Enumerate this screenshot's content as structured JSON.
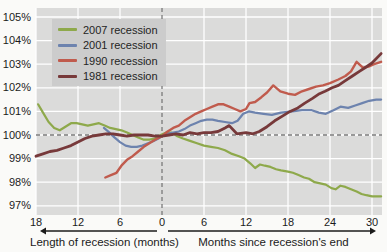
{
  "chart_data": {
    "type": "line",
    "title": "",
    "y_axis": {
      "unit": "%",
      "range": [
        97,
        105
      ],
      "ticks": [
        {
          "value": 105,
          "label": "105%"
        },
        {
          "value": 104,
          "label": "104%"
        },
        {
          "value": 103,
          "label": "103%"
        },
        {
          "value": 102,
          "label": "102%"
        },
        {
          "value": 101,
          "label": "101%"
        },
        {
          "value": 100,
          "label": "100%"
        },
        {
          "value": 99,
          "label": "99%"
        },
        {
          "value": 98,
          "label": "98%"
        },
        {
          "value": 97,
          "label": "97%"
        }
      ]
    },
    "x_axis": {
      "range_months": [
        -18,
        31
      ],
      "left_caption": "Length of recession (months)",
      "right_caption": "Months since recession's end",
      "ticks": [
        {
          "month": -18,
          "label": "18"
        },
        {
          "month": -12,
          "label": "12"
        },
        {
          "month": -6,
          "label": "6"
        },
        {
          "month": 0,
          "label": "0"
        },
        {
          "month": 6,
          "label": "6"
        },
        {
          "month": 12,
          "label": "12"
        },
        {
          "month": 18,
          "label": "18"
        },
        {
          "month": 24,
          "label": "24"
        },
        {
          "month": 30,
          "label": "30"
        }
      ],
      "gridline_months": [
        -18,
        -12,
        -6,
        6,
        12,
        18,
        24,
        30
      ]
    },
    "reference_lines": {
      "vertical_month": 0,
      "horizontal_value": 100,
      "style": "dashed",
      "color": "#7a7a7a"
    },
    "legend_position": "top-left",
    "grid": true,
    "colors": {
      "plot_background": "#dbdbda",
      "legend_background": "#cccccc",
      "gridline": "#ffffff",
      "text": "#1b1b1b"
    },
    "series": [
      {
        "name": "2007 recession",
        "color": "#8ea94b",
        "width": 2.2,
        "points": [
          [
            -17.7,
            101.3
          ],
          [
            -17,
            100.95
          ],
          [
            -16.2,
            100.55
          ],
          [
            -15.4,
            100.3
          ],
          [
            -14.6,
            100.2
          ],
          [
            -13.8,
            100.35
          ],
          [
            -13,
            100.5
          ],
          [
            -12.2,
            100.5
          ],
          [
            -11.4,
            100.45
          ],
          [
            -10.6,
            100.4
          ],
          [
            -9.8,
            100.45
          ],
          [
            -9,
            100.5
          ],
          [
            -8.2,
            100.4
          ],
          [
            -7.4,
            100.3
          ],
          [
            -6.6,
            100.25
          ],
          [
            -5.8,
            100.2
          ],
          [
            -5,
            100.1
          ],
          [
            -4.2,
            100.0
          ],
          [
            -3.4,
            99.9
          ],
          [
            -2.6,
            99.8
          ],
          [
            -1.8,
            99.8
          ],
          [
            -1,
            99.85
          ],
          [
            -0.2,
            100.0
          ],
          [
            0.6,
            100.1
          ],
          [
            1.4,
            100.1
          ],
          [
            2.2,
            99.95
          ],
          [
            3,
            99.85
          ],
          [
            4,
            99.75
          ],
          [
            5,
            99.65
          ],
          [
            6,
            99.55
          ],
          [
            7,
            99.5
          ],
          [
            8,
            99.45
          ],
          [
            9,
            99.35
          ],
          [
            10,
            99.2
          ],
          [
            11,
            99.1
          ],
          [
            11.8,
            99.0
          ],
          [
            12.6,
            98.8
          ],
          [
            13.3,
            98.6
          ],
          [
            14,
            98.75
          ],
          [
            14.7,
            98.7
          ],
          [
            15.5,
            98.65
          ],
          [
            16.3,
            98.55
          ],
          [
            17,
            98.5
          ],
          [
            18,
            98.45
          ],
          [
            18.7,
            98.4
          ],
          [
            19.5,
            98.3
          ],
          [
            20.3,
            98.2
          ],
          [
            21,
            98.15
          ],
          [
            21.8,
            98.0
          ],
          [
            22.6,
            97.95
          ],
          [
            23.4,
            97.9
          ],
          [
            24.2,
            97.75
          ],
          [
            24.8,
            97.7
          ],
          [
            25.5,
            97.85
          ],
          [
            26.2,
            97.8
          ],
          [
            27,
            97.7
          ],
          [
            27.8,
            97.6
          ],
          [
            28.5,
            97.5
          ],
          [
            29.2,
            97.45
          ],
          [
            30,
            97.4
          ],
          [
            31.3,
            97.4
          ]
        ]
      },
      {
        "name": "2001 recession",
        "color": "#6d83ae",
        "width": 2.2,
        "points": [
          [
            -8.3,
            100.3
          ],
          [
            -7.5,
            100.1
          ],
          [
            -6.8,
            99.9
          ],
          [
            -6,
            99.7
          ],
          [
            -5.2,
            99.55
          ],
          [
            -4.4,
            99.5
          ],
          [
            -3.6,
            99.5
          ],
          [
            -2.8,
            99.55
          ],
          [
            -2,
            99.65
          ],
          [
            -1.2,
            99.75
          ],
          [
            -0.5,
            99.85
          ],
          [
            0,
            99.95
          ],
          [
            0.8,
            100.05
          ],
          [
            1.6,
            100.1
          ],
          [
            2.4,
            100.15
          ],
          [
            3.2,
            100.25
          ],
          [
            4,
            100.4
          ],
          [
            4.8,
            100.5
          ],
          [
            5.6,
            100.6
          ],
          [
            6.4,
            100.65
          ],
          [
            7.2,
            100.65
          ],
          [
            8,
            100.6
          ],
          [
            9,
            100.55
          ],
          [
            10,
            100.5
          ],
          [
            10.8,
            100.6
          ],
          [
            11.6,
            100.9
          ],
          [
            12.4,
            101.0
          ],
          [
            13.3,
            100.95
          ],
          [
            14.5,
            100.9
          ],
          [
            15.7,
            100.85
          ],
          [
            17,
            100.95
          ],
          [
            18.6,
            101.0
          ],
          [
            20,
            101.05
          ],
          [
            21.4,
            101.05
          ],
          [
            22.4,
            100.95
          ],
          [
            23.4,
            100.9
          ],
          [
            24.5,
            101.05
          ],
          [
            25.5,
            101.2
          ],
          [
            26.6,
            101.15
          ],
          [
            27.6,
            101.25
          ],
          [
            28.6,
            101.35
          ],
          [
            29.6,
            101.45
          ],
          [
            30.6,
            101.5
          ],
          [
            31.3,
            101.5
          ]
        ]
      },
      {
        "name": "1990 recession",
        "color": "#c05b4d",
        "width": 2.4,
        "points": [
          [
            -8.1,
            98.2
          ],
          [
            -7.3,
            98.3
          ],
          [
            -6.5,
            98.4
          ],
          [
            -5.8,
            98.7
          ],
          [
            -5,
            98.95
          ],
          [
            -4.2,
            99.1
          ],
          [
            -3.4,
            99.3
          ],
          [
            -2.6,
            99.5
          ],
          [
            -1.8,
            99.65
          ],
          [
            -1,
            99.8
          ],
          [
            0,
            99.95
          ],
          [
            0.8,
            100.15
          ],
          [
            1.6,
            100.3
          ],
          [
            2.4,
            100.4
          ],
          [
            3.2,
            100.6
          ],
          [
            4,
            100.75
          ],
          [
            4.8,
            100.9
          ],
          [
            5.6,
            101.0
          ],
          [
            6.4,
            101.1
          ],
          [
            7.2,
            101.2
          ],
          [
            8,
            101.3
          ],
          [
            8.8,
            101.3
          ],
          [
            9.6,
            101.2
          ],
          [
            10.4,
            101.1
          ],
          [
            11.2,
            101.0
          ],
          [
            12,
            101.1
          ],
          [
            12.5,
            101.35
          ],
          [
            13.3,
            101.4
          ],
          [
            14.2,
            101.6
          ],
          [
            15,
            101.8
          ],
          [
            15.9,
            102.1
          ],
          [
            16.9,
            101.85
          ],
          [
            18,
            101.75
          ],
          [
            19,
            101.7
          ],
          [
            20,
            101.85
          ],
          [
            21,
            101.95
          ],
          [
            22,
            102.05
          ],
          [
            23,
            102.1
          ],
          [
            24,
            102.2
          ],
          [
            25.2,
            102.35
          ],
          [
            26.2,
            102.5
          ],
          [
            27,
            102.7
          ],
          [
            27.8,
            103.1
          ],
          [
            28.7,
            102.85
          ],
          [
            29.5,
            102.9
          ],
          [
            30.3,
            103.0
          ],
          [
            31.3,
            103.1
          ]
        ]
      },
      {
        "name": "1981 recession",
        "color": "#77393a",
        "width": 2.8,
        "points": [
          [
            -18,
            99.1
          ],
          [
            -17,
            99.2
          ],
          [
            -16,
            99.3
          ],
          [
            -15,
            99.35
          ],
          [
            -14,
            99.45
          ],
          [
            -13,
            99.55
          ],
          [
            -12,
            99.7
          ],
          [
            -11,
            99.85
          ],
          [
            -10,
            99.95
          ],
          [
            -9,
            100.0
          ],
          [
            -8,
            100.05
          ],
          [
            -7,
            100.05
          ],
          [
            -6,
            100.0
          ],
          [
            -5,
            99.95
          ],
          [
            -4,
            100.0
          ],
          [
            -3,
            100.0
          ],
          [
            -2,
            100.0
          ],
          [
            -1,
            99.95
          ],
          [
            0,
            99.95
          ],
          [
            1,
            100.0
          ],
          [
            2,
            100.05
          ],
          [
            3,
            100.0
          ],
          [
            4,
            100.1
          ],
          [
            5,
            100.05
          ],
          [
            6,
            100.1
          ],
          [
            7,
            100.1
          ],
          [
            8,
            100.15
          ],
          [
            9,
            100.3
          ],
          [
            9.6,
            100.4
          ],
          [
            10.7,
            100.05
          ],
          [
            12,
            100.1
          ],
          [
            13,
            100.05
          ],
          [
            13.9,
            100.15
          ],
          [
            15,
            100.35
          ],
          [
            16.1,
            100.6
          ],
          [
            17.2,
            100.8
          ],
          [
            18.3,
            101.0
          ],
          [
            19.4,
            101.15
          ],
          [
            20.4,
            101.35
          ],
          [
            21.5,
            101.55
          ],
          [
            22.5,
            101.75
          ],
          [
            23.3,
            101.85
          ],
          [
            24.3,
            102.0
          ],
          [
            25.2,
            102.1
          ],
          [
            26.2,
            102.3
          ],
          [
            27.2,
            102.5
          ],
          [
            28.2,
            102.7
          ],
          [
            29,
            102.85
          ],
          [
            30,
            103.05
          ],
          [
            31.3,
            103.45
          ]
        ]
      }
    ]
  }
}
